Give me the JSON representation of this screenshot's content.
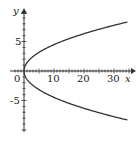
{
  "chart_data": {
    "type": "line",
    "title": "",
    "xlabel": "x",
    "ylabel": "y",
    "xlim": [
      0,
      35
    ],
    "ylim": [
      -10,
      10
    ],
    "x_ticks": [
      "0",
      "10",
      "20",
      "30"
    ],
    "y_ticks": [
      "5",
      "-5"
    ],
    "grid": false,
    "series": [
      {
        "name": "x = y^2/2",
        "x": [
          32,
          18,
          8,
          2,
          0,
          2,
          8,
          18,
          32
        ],
        "y": [
          8,
          6,
          4,
          2,
          0,
          -2,
          -4,
          -6,
          -8
        ]
      }
    ]
  },
  "labels": {
    "x": "x",
    "y": "y",
    "x0": "0",
    "x10": "10",
    "x20": "20",
    "x30": "30",
    "y5": "5",
    "ym5": "-5"
  }
}
